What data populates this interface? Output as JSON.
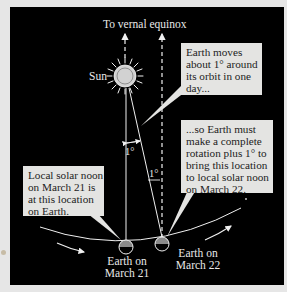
{
  "figure": {
    "title_label": "To vernal equinox",
    "sun_label": "Sun",
    "callouts": [
      {
        "id": "earth-moves",
        "lines": [
          "Earth moves",
          "about 1° around",
          "its orbit in one",
          "day..."
        ]
      },
      {
        "id": "complete-rotation",
        "lines": [
          "...so Earth must",
          "make a complete",
          "rotation plus 1° to",
          "bring this location",
          "to local solar noon",
          "on March 22."
        ]
      },
      {
        "id": "local-noon-march21",
        "lines": [
          "Local solar noon",
          "on March 21 is",
          "at this location",
          "on Earth."
        ]
      }
    ],
    "angle_labels": [
      "1°",
      "1°"
    ],
    "earth_labels": [
      {
        "lines": [
          "Earth on",
          "March 21"
        ]
      },
      {
        "lines": [
          "Earth on",
          "March 22"
        ]
      }
    ],
    "colors": {
      "background": "#000000",
      "page": "#e6e6e6",
      "callout_fill": "#e4e4e2",
      "line": "#f0f0f0",
      "sun_disc": "#c9c9c9",
      "earth_day": "#8a8a8a"
    }
  }
}
